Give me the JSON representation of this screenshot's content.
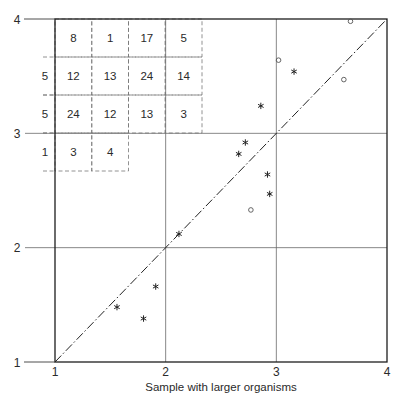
{
  "chart_data": {
    "type": "scatter",
    "title": "",
    "xlabel": "Sample with larger organisms",
    "ylabel": "",
    "xlim": [
      1,
      4
    ],
    "ylim": [
      1,
      4
    ],
    "x_ticks": [
      "1",
      "2",
      "3",
      "4"
    ],
    "y_ticks": [
      "1",
      "2",
      "3",
      "4"
    ],
    "grid": true,
    "legend": null,
    "reference_line": {
      "type": "identity",
      "style": "dash-dot",
      "from": [
        1,
        1
      ],
      "to": [
        4,
        4
      ]
    },
    "series": [
      {
        "name": "asterisk",
        "marker": "*",
        "points": [
          [
            3.16,
            3.54
          ],
          [
            2.86,
            3.24
          ],
          [
            2.72,
            2.92
          ],
          [
            2.66,
            2.82
          ],
          [
            2.92,
            2.64
          ],
          [
            2.94,
            2.47
          ],
          [
            2.12,
            2.12
          ],
          [
            1.91,
            1.66
          ],
          [
            1.56,
            1.48
          ],
          [
            1.8,
            1.38
          ]
        ]
      },
      {
        "name": "circle",
        "marker": "o",
        "points": [
          [
            3.67,
            3.98
          ],
          [
            3.02,
            3.64
          ],
          [
            3.61,
            3.47
          ],
          [
            2.77,
            2.33
          ]
        ]
      }
    ],
    "inset_table": {
      "rows": [
        {
          "label": "",
          "values": [
            "8",
            "1",
            "17",
            "5"
          ]
        },
        {
          "label": "5",
          "values": [
            "12",
            "13",
            "24",
            "14"
          ]
        },
        {
          "label": "5",
          "values": [
            "24",
            "12",
            "13",
            "3"
          ]
        },
        {
          "label": "1",
          "values": [
            "3",
            "4"
          ]
        }
      ]
    }
  }
}
